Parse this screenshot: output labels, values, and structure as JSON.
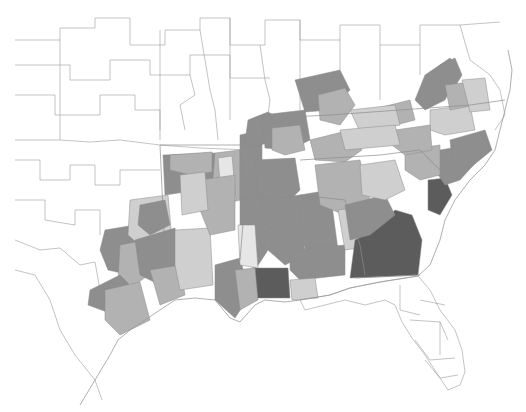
{
  "map": {
    "type": "choropleth",
    "region": "Southeastern United States",
    "shade_classes": {
      "none": "#ffffff",
      "c1": "#e6e6e6",
      "c2": "#cfcfcf",
      "c3": "#b2b2b2",
      "c4": "#8e8e8e",
      "c5": "#5c5c5c"
    },
    "regions": [
      {
        "id": "tx-northeast-a",
        "class": "c4",
        "points": "163,155 215,153 215,178 205,195 185,192 165,195"
      },
      {
        "id": "tx-northeast-b",
        "class": "c3",
        "points": "170,155 212,152 212,172 190,175 170,170"
      },
      {
        "id": "ar-west",
        "class": "c3",
        "points": "215,153 240,150 240,200 220,205 212,190"
      },
      {
        "id": "ar-central-light",
        "class": "c1",
        "points": "218,158 232,156 236,200 222,205"
      },
      {
        "id": "ar-east",
        "class": "c4",
        "points": "240,135 262,130 262,210 245,215 240,200"
      },
      {
        "id": "mo-bootheel",
        "class": "c4",
        "points": "248,120 268,112 278,118 272,140 255,148 245,142"
      },
      {
        "id": "tn-west-a",
        "class": "c4",
        "points": "262,115 305,110 310,140 290,150 265,148"
      },
      {
        "id": "tn-west-b",
        "class": "c3",
        "points": "272,128 300,125 305,150 285,155 272,150"
      },
      {
        "id": "ky-west",
        "class": "c4",
        "points": "295,80 340,70 350,90 330,110 305,112"
      },
      {
        "id": "ky-central",
        "class": "c3",
        "points": "318,95 345,88 355,105 340,125 320,120"
      },
      {
        "id": "tn-central",
        "class": "c3",
        "points": "310,140 350,130 362,150 345,162 315,160"
      },
      {
        "id": "ms-north",
        "class": "c4",
        "points": "255,160 295,158 300,190 285,205 258,200"
      },
      {
        "id": "ms-delta",
        "class": "c4",
        "points": "240,200 262,195 268,250 255,270 240,255"
      },
      {
        "id": "ms-central",
        "class": "c4",
        "points": "262,200 300,195 305,255 285,265 268,250"
      },
      {
        "id": "ms-south-dark",
        "class": "c5",
        "points": "255,268 288,268 290,298 255,298"
      },
      {
        "id": "al-west",
        "class": "c4",
        "points": "300,195 330,190 338,250 310,260 302,240"
      },
      {
        "id": "al-central",
        "class": "c3",
        "points": "315,165 360,160 370,200 345,215 320,205"
      },
      {
        "id": "al-south",
        "class": "c4",
        "points": "290,250 345,245 345,275 300,280 290,270"
      },
      {
        "id": "al-southeast-light",
        "class": "c2",
        "points": "338,210 375,205 378,245 345,250"
      },
      {
        "id": "ga-dark",
        "class": "c5",
        "points": "355,240 378,228 395,210 412,215 422,240 418,275 350,278"
      },
      {
        "id": "ga-northwest",
        "class": "c4",
        "points": "345,205 385,195 395,215 370,235 350,240"
      },
      {
        "id": "ga-north-light",
        "class": "c2",
        "points": "360,165 395,160 405,190 385,200 362,195"
      },
      {
        "id": "sc-coast-dark",
        "class": "c5",
        "points": "428,180 445,178 452,195 440,215 428,210"
      },
      {
        "id": "sc-coast",
        "class": "c4",
        "points": "440,150 470,145 478,160 460,180 445,185 435,170"
      },
      {
        "id": "sc-upstate",
        "class": "c3",
        "points": "405,150 440,145 440,175 420,180 405,170"
      },
      {
        "id": "nc-east",
        "class": "c4",
        "points": "450,140 485,130 492,150 470,168 452,160"
      },
      {
        "id": "nc-central-light",
        "class": "c2",
        "points": "430,110 470,105 475,130 445,135 430,130"
      },
      {
        "id": "nc-west",
        "class": "c3",
        "points": "395,130 430,125 432,150 405,155 392,145"
      },
      {
        "id": "va-southwest",
        "class": "c3",
        "points": "370,110 410,100 415,120 385,128 365,125"
      },
      {
        "id": "va-ridge-a",
        "class": "c4",
        "points": "425,75 450,58 460,70 445,100 425,110 415,100"
      },
      {
        "id": "va-ridge-b",
        "class": "c4",
        "points": "440,65 455,58 462,75 450,95 440,90"
      },
      {
        "id": "va-central",
        "class": "c3",
        "points": "445,85 470,82 475,105 450,110"
      },
      {
        "id": "va-east-light",
        "class": "c2",
        "points": "462,80 485,78 490,110 470,112"
      },
      {
        "id": "ky-east-light",
        "class": "c2",
        "points": "350,110 395,105 400,125 360,132"
      },
      {
        "id": "tn-east-light",
        "class": "c2",
        "points": "340,130 395,125 400,145 345,150"
      },
      {
        "id": "tx-east-a",
        "class": "c4",
        "points": "105,230 135,225 145,240 130,275 108,270 100,250"
      },
      {
        "id": "tx-east-b",
        "class": "c3",
        "points": "120,245 145,240 155,270 135,285 118,280"
      },
      {
        "id": "tx-east-light",
        "class": "c2",
        "points": "130,200 168,195 172,240 145,250 128,235"
      },
      {
        "id": "tx-east-dark",
        "class": "c4",
        "points": "140,205 165,200 170,225 150,235 138,225"
      },
      {
        "id": "tx-gulf-a",
        "class": "c4",
        "points": "90,290 120,275 135,290 115,315 88,305"
      },
      {
        "id": "tx-gulf-b",
        "class": "c3",
        "points": "105,290 140,282 150,320 120,335 105,320"
      },
      {
        "id": "tx-piney-woods",
        "class": "c4",
        "points": "135,240 175,228 180,270 160,285 140,275"
      },
      {
        "id": "tx-southeast",
        "class": "c3",
        "points": "150,270 180,265 185,295 160,305"
      },
      {
        "id": "la-west",
        "class": "c2",
        "points": "175,230 210,228 213,285 180,290 175,265"
      },
      {
        "id": "la-central",
        "class": "c3",
        "points": "200,180 235,175 235,230 210,235 200,210"
      },
      {
        "id": "la-north",
        "class": "c2",
        "points": "180,175 205,172 208,210 182,215"
      },
      {
        "id": "la-south-a",
        "class": "c4",
        "points": "215,265 240,258 250,295 235,318 215,300"
      },
      {
        "id": "la-south-b",
        "class": "c3",
        "points": "235,270 255,268 258,300 240,310"
      },
      {
        "id": "la-east-light",
        "class": "c1",
        "points": "238,225 255,225 258,268 240,265"
      },
      {
        "id": "ms-gulf-light",
        "class": "c2",
        "points": "290,280 315,278 318,298 292,300"
      }
    ],
    "outlines": [
      "M15,40 L60,40 L60,28 L95,28 L95,18 L130,18 L130,45 L165,45 L165,30 L200,30 L200,18 L230,18 L230,45 L265,45 L265,20 L300,20 L300,40 L340,40 L340,25 L380,25 L380,45 L420,45 L420,25 L460,25 L500,22",
      "M15,65 L70,65 L70,80 L110,80 L110,60 L150,60 L150,75 L190,75 L190,55 L230,55 L230,78 L270,78",
      "M15,95 L55,95 L55,115 L100,115 L100,95 L135,95 L135,110 L160,110 L160,130",
      "M15,140 L60,140 L90,142 L120,140 L160,145 L200,148 L250,150",
      "M15,160 L40,160 L40,180 L70,180 L70,165 L95,165 L95,185 L120,185 L120,170 L160,170",
      "M15,200 L45,200 L45,220 L75,225 L75,210 L100,210 L100,235",
      "M15,240 L40,250 L60,248 L80,265 L95,262 L100,290",
      "M15,270 L35,275 L50,300 L60,330 L75,355 L95,380 L102,400",
      "M160,30 L160,140",
      "M60,40 L60,140",
      "M230,18 L230,120",
      "M300,20 L300,110",
      "M340,40 L340,70",
      "M380,45 L380,100",
      "M420,45 L420,75",
      "M460,25 L470,60 L490,75 L500,90 L505,115 L495,130",
      "M260,45 L265,80 L270,100 L268,115",
      "M200,30 L205,60 L210,90 L215,110 L218,140",
      "M190,75 L195,95 L180,105 L185,130"
    ],
    "state_lines": [
      "M160,145 L260,145",
      "M270,118 L330,115 L400,110 L470,105 L505,100",
      "M300,160 L380,155 L420,150",
      "M300,195 L345,200 L360,245 L365,275",
      "M240,150 L245,200 L240,260",
      "M160,145 L165,255",
      "M420,150 L445,175",
      "M355,278 L420,275"
    ],
    "florida": {
      "outline": "M300,300 L330,295 L350,288 L380,282 L418,276 L430,290 L440,310 L455,330 L462,350 L465,372 L460,385 L448,390 L438,375 L425,355 L412,338 L402,322 L395,305 L385,300 L365,305 L345,300 L325,305 L305,310 Z",
      "counties": [
        "M400,285 L400,310 L420,315",
        "M420,300 L445,305",
        "M410,320 L440,322 L448,340",
        "M415,340 L430,360 L455,358",
        "M425,360 L440,378 L458,375",
        "M440,322 L440,355"
      ]
    },
    "coastline": "M80,405 L95,380 L110,355 L118,340 L130,330 L145,320 L160,310 L175,300 L195,298 L215,300 L230,318 L240,322 L255,305 L265,300 L285,302 L300,300 L330,295 L350,288 L380,282 L418,276 L430,265 L440,240 L445,220 L455,200 L470,180 L485,165 L495,150 L500,130 L505,110 L510,90 L512,70 L508,50"
  }
}
